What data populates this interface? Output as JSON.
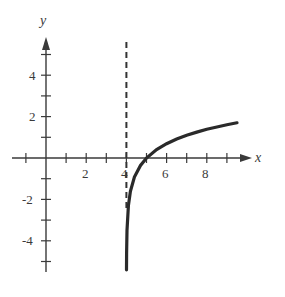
{
  "chart_data": {
    "type": "line",
    "title": "",
    "function": "y = ln(x - 4)",
    "xlabel": "x",
    "ylabel": "y",
    "xlim": [
      -1.5,
      10.2
    ],
    "ylim": [
      -5.5,
      5.8
    ],
    "x_ticks": [
      -1,
      1,
      2,
      3,
      4,
      5,
      6,
      7,
      8,
      9
    ],
    "x_tick_labels": {
      "2": "2",
      "4": "4",
      "6": "6",
      "8": "8"
    },
    "y_ticks": [
      -5,
      -4,
      -3,
      -2,
      -1,
      1,
      2,
      3,
      4,
      5
    ],
    "y_tick_labels": {
      "4": "4",
      "2": "2",
      "-2": "-2",
      "-4": "-4"
    },
    "asymptote": {
      "type": "vertical",
      "x": 4,
      "style": "dashed"
    },
    "series": [
      {
        "name": "curve",
        "x": [
          4.003,
          4.01,
          4.03,
          4.1,
          4.2,
          4.4,
          4.7,
          5.0,
          5.5,
          6.0,
          6.5,
          7.0,
          7.5,
          8.0,
          8.5,
          9.0,
          9.5
        ],
        "values": [
          -5.5,
          -4.6,
          -3.5,
          -2.3,
          -1.61,
          -0.92,
          -0.36,
          0,
          0.41,
          0.69,
          0.92,
          1.1,
          1.25,
          1.39,
          1.5,
          1.61,
          1.7
        ]
      }
    ],
    "grid": false,
    "legend": null
  },
  "axes": {
    "x_label": "x",
    "y_label": "y",
    "x_tick_labels": [
      "2",
      "4",
      "6",
      "8"
    ],
    "y_tick_labels": [
      "4",
      "2",
      "-2",
      "-4"
    ]
  }
}
